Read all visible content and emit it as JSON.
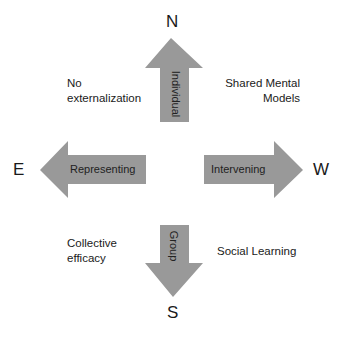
{
  "compass": {
    "north": "N",
    "south": "S",
    "east": "E",
    "west": "W"
  },
  "arrows": {
    "up": "Individual",
    "down": "Group",
    "left": "Representing",
    "right": "Intervening"
  },
  "quadrants": {
    "top_left": [
      "No",
      "externalization"
    ],
    "top_right": [
      "Shared Mental",
      "Models"
    ],
    "bottom_left": [
      "Collective",
      "efficacy"
    ],
    "bottom_right": [
      "Social Learning"
    ]
  },
  "colors": {
    "arrow_fill": "#999999",
    "text": "#1a1a1a",
    "background": "#ffffff"
  }
}
